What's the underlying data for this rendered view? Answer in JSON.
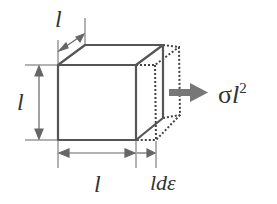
{
  "diagram": {
    "labels": {
      "depth": "l",
      "height": "l",
      "width": "l",
      "elongation": "ldε",
      "force_sigma": "σ",
      "force_l": "l",
      "force_exp": "2"
    },
    "colors": {
      "edge": "#555555",
      "dotted": "#444444",
      "arrow": "#777777",
      "text": "#333333"
    }
  }
}
